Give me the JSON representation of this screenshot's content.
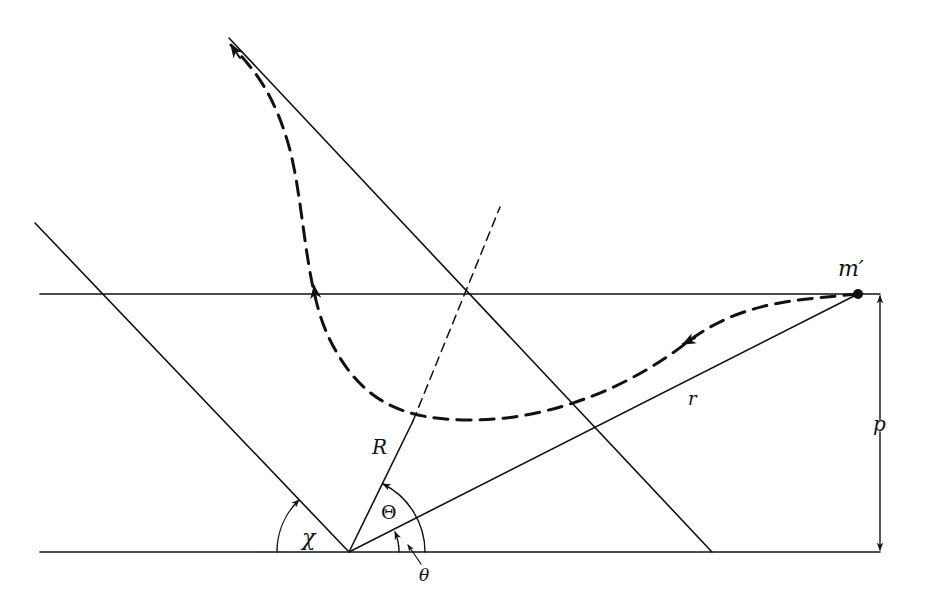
{
  "figure": {
    "type": "scattering-geometry-diagram",
    "colors": {
      "stroke": "#111111",
      "background": "#ffffff"
    },
    "labels": {
      "particle": "m′",
      "impact_parameter": "p",
      "radius_vector": "r",
      "apse_distance": "R",
      "apse_angle": "Θ",
      "deflection_angle": "χ",
      "polar_angle": "θ"
    },
    "elements": [
      "baseline (horizontal through origin)",
      "incoming line (horizontal through m′ at impact parameter p)",
      "radius vector r from origin to m′",
      "apse line R from origin (dashed extension beyond trajectory)",
      "outgoing asymptote direction through origin at angle χ",
      "outgoing asymptote of trajectory (parallel)",
      "dashed particle trajectory with direction arrows",
      "impact parameter dimension arrow p",
      "angle arcs χ, Θ, θ"
    ]
  }
}
